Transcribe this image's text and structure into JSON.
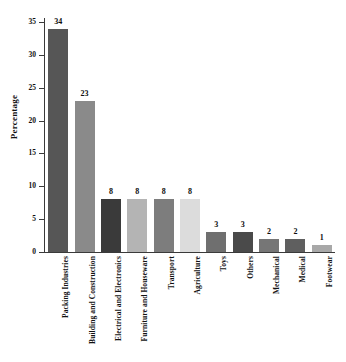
{
  "chart_data": {
    "type": "bar",
    "title": "",
    "xlabel": "",
    "ylabel": "Percentage",
    "ylim": [
      0,
      35
    ],
    "yticks": [
      0,
      5,
      10,
      15,
      20,
      25,
      30,
      35
    ],
    "ytick_labels": [
      "0",
      "5",
      "10",
      "15",
      "20",
      "25",
      "30",
      "35"
    ],
    "grid": false,
    "legend": "none",
    "categories": [
      "Packing  Industries",
      "Building and Construction",
      "Electrical and Electronics",
      "Furniture and Houseware",
      "Transport",
      "Agriculture",
      "Toys",
      "Others",
      "Mechanical",
      "Medical",
      "Footwear"
    ],
    "values": [
      34,
      23,
      8,
      8,
      8,
      8,
      3,
      3,
      2,
      2,
      1
    ],
    "value_labels": [
      "34",
      "23",
      "8",
      "8",
      "8",
      "8",
      "3",
      "3",
      "2",
      "2",
      "1"
    ],
    "bar_colors": [
      "#565656",
      "#8a8a8a",
      "#3a3a3a",
      "#b4b4b4",
      "#7d7d7d",
      "#dcdcdc",
      "#6f6f6f",
      "#4a4a4a",
      "#767676",
      "#5f5f5f",
      "#a8a8a8"
    ],
    "axis_color": "#3a3a3a",
    "background_color": "#ffffff",
    "text_color": "#111111"
  }
}
